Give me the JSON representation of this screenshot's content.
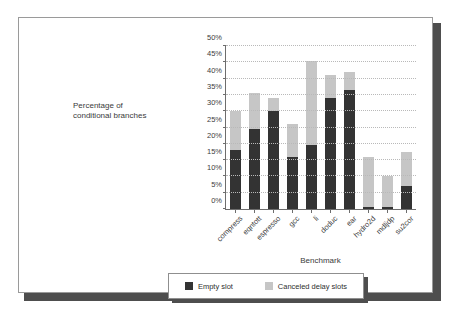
{
  "slide": {
    "y_axis_title_line1": "Percentage of",
    "y_axis_title_line2": "conditional branches"
  },
  "legend": {
    "items": [
      {
        "label": "Empty slot",
        "color": "#333333",
        "swatch_name": "empty-slot-swatch"
      },
      {
        "label": "Canceled delay slots",
        "color": "#c6c6c6",
        "swatch_name": "canceled-delay-slots-swatch"
      }
    ]
  },
  "chart_data": {
    "type": "bar",
    "stacked": true,
    "title": "",
    "xlabel": "Benchmark",
    "ylabel": "Percentage of conditional branches",
    "ylim": [
      0,
      50
    ],
    "ytick_labels": [
      "0%",
      "5%",
      "10%",
      "15%",
      "20%",
      "25%",
      "30%",
      "35%",
      "40%",
      "45%",
      "50%"
    ],
    "ytick_values": [
      0,
      5,
      10,
      15,
      20,
      25,
      30,
      35,
      40,
      45,
      50
    ],
    "grid": true,
    "legend_position": "below-plot",
    "categories": [
      "compress",
      "eqntott",
      "espresso",
      "gcc",
      "li",
      "doduc",
      "ear",
      "hydro2d",
      "mdljdp",
      "su2cor"
    ],
    "series": [
      {
        "name": "Empty slot",
        "color": "#333333",
        "values": [
          18,
          24.5,
          30,
          16,
          19.5,
          34,
          36.5,
          0.5,
          0.5,
          7
        ]
      },
      {
        "name": "Canceled delay slots",
        "color": "#c6c6c6",
        "values": [
          12,
          11,
          4,
          10,
          26,
          7,
          5.5,
          15.5,
          9.5,
          10.5
        ]
      }
    ],
    "totals": [
      30,
      35.5,
      34,
      26,
      45.5,
      41,
      42,
      16,
      10,
      17.5
    ]
  }
}
